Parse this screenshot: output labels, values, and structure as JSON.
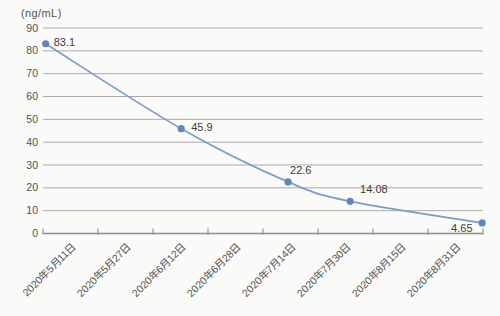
{
  "chart_data": {
    "type": "line",
    "title": "",
    "unit_label": "(ng/mL)",
    "xlabel": "",
    "ylabel": "(ng/mL)",
    "ylim": [
      0,
      90
    ],
    "y_ticks": [
      0,
      10,
      20,
      30,
      40,
      50,
      60,
      70,
      80,
      90
    ],
    "grid": "horizontal",
    "legend_position": "none",
    "categories": [
      "2020年5月11日",
      "2020年5月27日",
      "2020年6月12日",
      "2020年6月28日",
      "2020年7月14日",
      "2020年7月30日",
      "2020年8月15日",
      "2020年8月31日"
    ],
    "series": [
      {
        "name": "ng/mL",
        "points": [
          {
            "category": "2020年5月11日",
            "category_index": 0,
            "value": 83.1,
            "label": "83.1"
          },
          {
            "category": "2020年6月12日",
            "category_index": 2,
            "value": 45.9,
            "label": "45.9"
          },
          {
            "category": "2020年7月14日",
            "category_index": 4,
            "value": 22.6,
            "label": "22.6"
          },
          {
            "category": "2020年7月30日",
            "category_index": 5,
            "value": 14.08,
            "label": "14.08"
          },
          {
            "category": "2020年8月31日",
            "category_index": 7,
            "value": 4.65,
            "label": "4.65"
          }
        ]
      }
    ],
    "colors": {
      "line": "#7e9ac9",
      "marker": "#6186bd",
      "grid": "#adaba7",
      "axis": "#8f8d89",
      "tick_text": "#55534f",
      "label_text": "#3d3c3a",
      "background": "#fafaf8"
    },
    "layout": {
      "plot_left": 43,
      "plot_right": 483,
      "plot_top": 28,
      "plot_bottom": 233.5,
      "x_intervals": 8,
      "x_label_rotation": -45,
      "smooth": true,
      "marker_radius": 3.6,
      "point_x_fractions": [
        0.006,
        0.314,
        0.557,
        0.698,
        0.998
      ],
      "point_label_offsets": [
        [
          8,
          2
        ],
        [
          10,
          2
        ],
        [
          2,
          -8
        ],
        [
          10,
          -8
        ],
        [
          -31,
          9
        ]
      ]
    }
  }
}
